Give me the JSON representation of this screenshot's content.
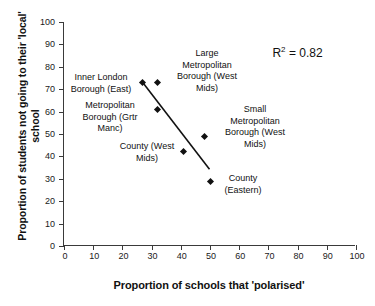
{
  "chart_data": {
    "type": "scatter",
    "title": "",
    "xlabel": "Proportion of schools that 'polarised'",
    "ylabel": "Proportion of students not going to\ntheir 'local' school",
    "xlim": [
      0,
      100
    ],
    "ylim": [
      0,
      100
    ],
    "xticks": [
      0,
      10,
      20,
      30,
      40,
      50,
      60,
      70,
      80,
      90,
      100
    ],
    "yticks": [
      0,
      10,
      20,
      30,
      40,
      50,
      60,
      70,
      80,
      90,
      100
    ],
    "grid": false,
    "legend": null,
    "points": [
      {
        "label": "Inner London Borough (East)",
        "x": 27,
        "y": 73
      },
      {
        "label": "Large Metropolitan Borough (West Mids)",
        "x": 32,
        "y": 73
      },
      {
        "label": "Metropolitan Borough (Grtr Manc)",
        "x": 32,
        "y": 61
      },
      {
        "label": "County (West Mids)",
        "x": 41,
        "y": 42
      },
      {
        "label": "Small Metropolitan Borough (West Mids)",
        "x": 48,
        "y": 49
      },
      {
        "label": "County (Eastern)",
        "x": 50,
        "y": 29
      }
    ],
    "trendline": {
      "x1": 27,
      "y1": 73,
      "x2": 50,
      "y2": 34
    },
    "annotations": [
      {
        "name": "r-squared",
        "text": "R",
        "superscript": "2",
        "suffix": " = 0.82",
        "x": 82,
        "y": 86
      }
    ]
  },
  "labels": {
    "inner_london": "Inner London\nBorough (East)",
    "large_met": "Large\nMetropolitan\nBorough (West\nMids)",
    "grtr_manc": "Metropolitan\nBorough (Grtr\nManc)",
    "county_west_mids": "County (West\nMids)",
    "small_met": "Small\nMetropolitan\nBorough (West\nMids)",
    "county_eastern": "County\n(Eastern)"
  },
  "rsquared": {
    "symbol": "R",
    "exponent": "2",
    "value": " = 0.82"
  },
  "colors": {
    "axis": "#3a3a3a",
    "marker": "#111111",
    "trendline": "#111111",
    "text": "#111111",
    "background": "#ffffff"
  }
}
